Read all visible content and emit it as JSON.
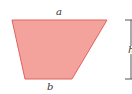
{
  "figure": {
    "shape": "trapezoid",
    "labels": {
      "top_base": "a",
      "bottom_base": "b",
      "height": "h"
    },
    "colors": {
      "fill": "#f4a29c",
      "stroke": "#e0625e",
      "bracket": "#555555"
    }
  }
}
